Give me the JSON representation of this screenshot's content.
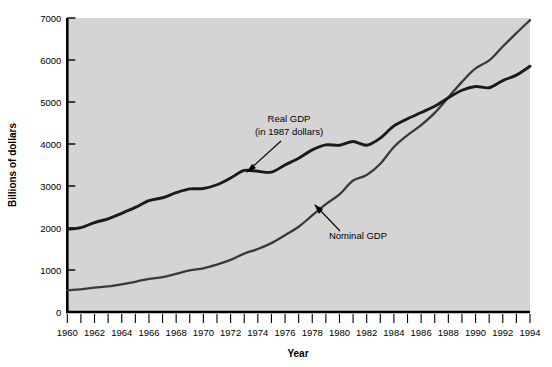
{
  "chart_data": {
    "type": "line",
    "title": "",
    "xlabel": "Year",
    "ylabel": "Billions of dollars",
    "xlim": [
      1960,
      1994
    ],
    "ylim": [
      0,
      7000
    ],
    "grid": false,
    "legend_position": "inline-annotations",
    "xticks_major": [
      1960,
      1962,
      1964,
      1966,
      1968,
      1970,
      1972,
      1974,
      1976,
      1978,
      1980,
      1982,
      1984,
      1986,
      1988,
      1990,
      1992,
      1994
    ],
    "xticks_minor_step": 1,
    "yticks": [
      0,
      1000,
      2000,
      3000,
      4000,
      5000,
      6000,
      7000
    ],
    "x": [
      1960,
      1961,
      1962,
      1963,
      1964,
      1965,
      1966,
      1967,
      1968,
      1969,
      1970,
      1971,
      1972,
      1973,
      1974,
      1975,
      1976,
      1977,
      1978,
      1979,
      1980,
      1981,
      1982,
      1983,
      1984,
      1985,
      1986,
      1987,
      1988,
      1989,
      1990,
      1991,
      1992,
      1993,
      1994
    ],
    "series": [
      {
        "name": "Real GDP",
        "annotation": "Real GDP\n(in 1987 dollars)",
        "color": "#1a1a1a",
        "linewidth": 2.9,
        "values": [
          1970,
          2010,
          2130,
          2220,
          2350,
          2490,
          2650,
          2720,
          2840,
          2930,
          2940,
          3030,
          3190,
          3370,
          3350,
          3330,
          3500,
          3660,
          3860,
          3980,
          3970,
          4060,
          3970,
          4140,
          4430,
          4600,
          4750,
          4900,
          5100,
          5280,
          5370,
          5340,
          5510,
          5640,
          5850
        ]
      },
      {
        "name": "Nominal GDP",
        "annotation": "Nominal GDP",
        "color": "#3a3a3a",
        "linewidth": 2.3,
        "values": [
          520,
          540,
          580,
          610,
          660,
          720,
          790,
          830,
          910,
          990,
          1040,
          1130,
          1240,
          1390,
          1500,
          1640,
          1830,
          2030,
          2300,
          2570,
          2800,
          3130,
          3260,
          3530,
          3930,
          4210,
          4450,
          4740,
          5110,
          5480,
          5800,
          5990,
          6320,
          6640,
          6950
        ]
      }
    ],
    "annotations": [
      {
        "label_line1": "Real GDP",
        "label_line2": "(in 1987 dollars)",
        "points_to_year": 1975,
        "points_to_value": 3330
      },
      {
        "label_line1": "Nominal GDP",
        "label_line2": "",
        "points_to_year": 1982,
        "points_to_value": 3260
      }
    ]
  },
  "colors": {
    "plot_background": "#d4d4d4",
    "page_background": "#ffffff",
    "axis": "#000000",
    "real_gdp": "#1a1a1a",
    "nominal_gdp": "#3a3a3a"
  }
}
